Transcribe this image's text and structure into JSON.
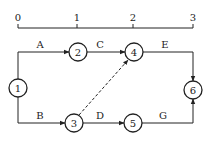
{
  "timeline": {
    "ticks": [
      {
        "label": "0",
        "x": 18
      },
      {
        "label": "1",
        "x": 77
      },
      {
        "label": "2",
        "x": 133
      },
      {
        "label": "3",
        "x": 193
      }
    ]
  },
  "nodes": [
    {
      "id": "1",
      "label": "1",
      "x": 18,
      "y": 88
    },
    {
      "id": "2",
      "label": "2",
      "x": 78,
      "y": 52
    },
    {
      "id": "3",
      "label": "3",
      "x": 74,
      "y": 123
    },
    {
      "id": "4",
      "label": "4",
      "x": 134,
      "y": 52
    },
    {
      "id": "5",
      "label": "5",
      "x": 133,
      "y": 123
    },
    {
      "id": "6",
      "label": "6",
      "x": 193,
      "y": 90
    }
  ],
  "edges": [
    {
      "label": "A",
      "from": "1",
      "to": "2",
      "style": "solid"
    },
    {
      "label": "B",
      "from": "1",
      "to": "3",
      "style": "solid"
    },
    {
      "label": "C",
      "from": "2",
      "to": "4",
      "style": "solid"
    },
    {
      "label": "D",
      "from": "3",
      "to": "5",
      "style": "solid"
    },
    {
      "label": "E",
      "from": "4",
      "to": "6",
      "style": "solid"
    },
    {
      "label": "G",
      "from": "5",
      "to": "6",
      "style": "solid"
    },
    {
      "label": "",
      "from": "3",
      "to": "4",
      "style": "dashed"
    }
  ]
}
